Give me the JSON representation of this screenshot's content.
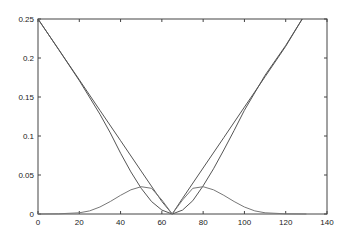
{
  "chart_data": {
    "type": "line",
    "title": "",
    "xlabel": "",
    "ylabel": "",
    "xlim": [
      0,
      140
    ],
    "ylim": [
      0,
      0.25
    ],
    "grid": false,
    "legend": null,
    "x_ticks": [
      "0",
      "20",
      "40",
      "60",
      "80",
      "100",
      "120",
      "140"
    ],
    "y_ticks": [
      "0",
      "0.05",
      "0.1",
      "0.15",
      "0.2",
      "0.25"
    ],
    "series": [
      {
        "name": "linear-v",
        "color": "#555555",
        "x": [
          0,
          10,
          20,
          30,
          40,
          50,
          60,
          65,
          70,
          80,
          90,
          100,
          110,
          120,
          128
        ],
        "y": [
          0.25,
          0.211,
          0.172,
          0.133,
          0.094,
          0.055,
          0.016,
          0.0,
          0.02,
          0.059,
          0.098,
          0.137,
          0.176,
          0.215,
          0.25
        ]
      },
      {
        "name": "smooth-v",
        "color": "#555555",
        "x": [
          0,
          10,
          20,
          30,
          35,
          40,
          45,
          50,
          55,
          60,
          65,
          70,
          75,
          80,
          85,
          90,
          95,
          100,
          110,
          120,
          128
        ],
        "y": [
          0.25,
          0.211,
          0.171,
          0.128,
          0.104,
          0.078,
          0.054,
          0.033,
          0.016,
          0.005,
          0.0,
          0.005,
          0.017,
          0.036,
          0.058,
          0.082,
          0.107,
          0.133,
          0.178,
          0.216,
          0.25
        ]
      },
      {
        "name": "bump",
        "color": "#777777",
        "x": [
          0,
          10,
          20,
          25,
          30,
          35,
          40,
          45,
          50,
          55,
          60,
          65,
          70,
          75,
          80,
          85,
          90,
          95,
          100,
          105,
          110,
          120,
          130
        ],
        "y": [
          0.0,
          0.0003,
          0.0015,
          0.004,
          0.009,
          0.016,
          0.024,
          0.031,
          0.035,
          0.033,
          0.018,
          0.0,
          0.018,
          0.033,
          0.035,
          0.031,
          0.024,
          0.016,
          0.009,
          0.004,
          0.0015,
          0.0003,
          0.0
        ]
      }
    ]
  }
}
